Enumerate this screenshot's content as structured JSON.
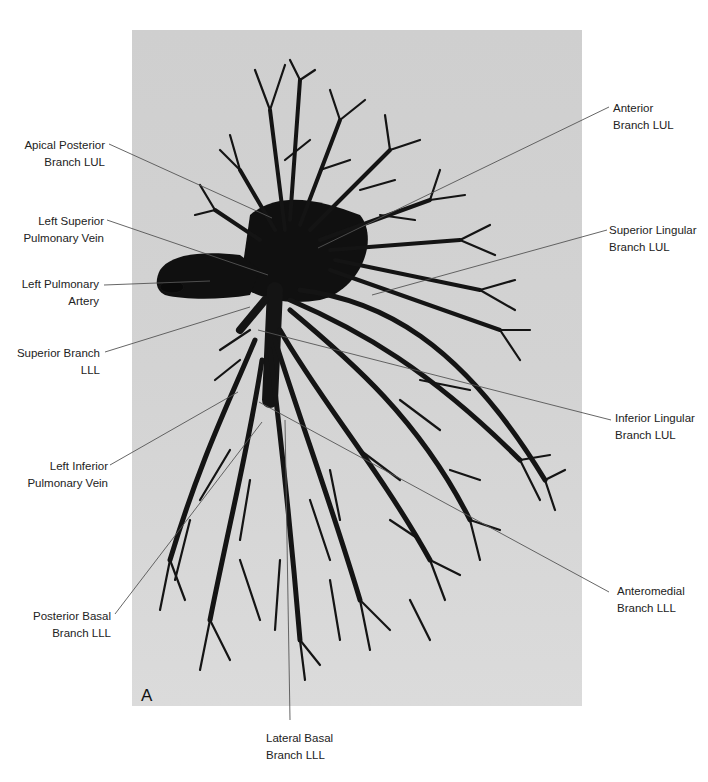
{
  "figure": {
    "panel_letter": "A",
    "photo_background": "#d2d2d2",
    "cast_color": "#141414",
    "leader_line_color": "#555555",
    "labels": [
      {
        "id": "apical-posterior-branch-lul",
        "line1": "Apical Posterior",
        "line2": "Branch LUL",
        "side": "left"
      },
      {
        "id": "left-superior-pulmonary-vein",
        "line1": "Left Superior",
        "line2": "Pulmonary Vein",
        "side": "left"
      },
      {
        "id": "left-pulmonary-artery",
        "line1": "Left Pulmonary",
        "line2": "Artery",
        "side": "left"
      },
      {
        "id": "superior-branch-lll",
        "line1": "Superior Branch",
        "line2": "LLL",
        "side": "left"
      },
      {
        "id": "left-inferior-pulmonary-vein",
        "line1": "Left Inferior",
        "line2": "Pulmonary Vein",
        "side": "left"
      },
      {
        "id": "posterior-basal-branch-lll",
        "line1": "Posterior Basal",
        "line2": "Branch LLL",
        "side": "left"
      },
      {
        "id": "anterior-branch-lul",
        "line1": "Anterior",
        "line2": "Branch LUL",
        "side": "right"
      },
      {
        "id": "superior-lingular-branch-lul",
        "line1": "Superior Lingular",
        "line2": "Branch LUL",
        "side": "right"
      },
      {
        "id": "inferior-lingular-branch-lul",
        "line1": "Inferior Lingular",
        "line2": "Branch LUL",
        "side": "right"
      },
      {
        "id": "anteromedial-branch-lll",
        "line1": "Anteromedial",
        "line2": "Branch LLL",
        "side": "right"
      },
      {
        "id": "lateral-basal-branch-lll",
        "line1": "Lateral Basal",
        "line2": "Branch LLL",
        "side": "bottom"
      }
    ]
  }
}
